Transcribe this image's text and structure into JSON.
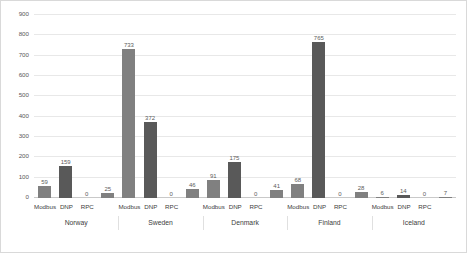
{
  "chart_data": {
    "type": "bar",
    "title": "",
    "subtitle": "",
    "xlabel": "",
    "ylabel": "",
    "ylim": [
      0,
      900
    ],
    "ytick_step": 100,
    "yticks": [
      0,
      100,
      200,
      300,
      400,
      500,
      600,
      700,
      800,
      900
    ],
    "ytick_labels": [
      "0",
      "100",
      "200",
      "300",
      "400",
      "500",
      "600",
      "700",
      "800",
      "900"
    ],
    "grid": true,
    "grid_axis": "y",
    "legend": false,
    "legend_position": "none",
    "categories": [
      "Norway",
      "Sweden",
      "Denmark",
      "Finland",
      "Iceland"
    ],
    "subcategories": [
      "Modbus",
      "DNP",
      "RPC",
      ""
    ],
    "bar_colors": [
      "#808080",
      "#595959",
      "#808080",
      "#808080"
    ],
    "groups": [
      {
        "name": "Norway",
        "bars": [
          {
            "label": "Modbus",
            "value": 59,
            "value_label": "59",
            "color": "#808080"
          },
          {
            "label": "DNP",
            "value": 159,
            "value_label": "159",
            "color": "#595959"
          },
          {
            "label": "RPC",
            "value": 0,
            "value_label": "0",
            "color": "#808080"
          },
          {
            "label": "",
            "value": 25,
            "value_label": "25",
            "color": "#808080"
          }
        ]
      },
      {
        "name": "Sweden",
        "bars": [
          {
            "label": "Modbus",
            "value": 733,
            "value_label": "733",
            "color": "#808080"
          },
          {
            "label": "DNP",
            "value": 372,
            "value_label": "372",
            "color": "#595959"
          },
          {
            "label": "RPC",
            "value": 0,
            "value_label": "0",
            "color": "#808080"
          },
          {
            "label": "",
            "value": 46,
            "value_label": "46",
            "color": "#808080"
          }
        ]
      },
      {
        "name": "Denmark",
        "bars": [
          {
            "label": "Modbus",
            "value": 91,
            "value_label": "91",
            "color": "#808080"
          },
          {
            "label": "DNP",
            "value": 175,
            "value_label": "175",
            "color": "#595959"
          },
          {
            "label": "RPC",
            "value": 0,
            "value_label": "0",
            "color": "#808080"
          },
          {
            "label": "",
            "value": 41,
            "value_label": "41",
            "color": "#808080"
          }
        ]
      },
      {
        "name": "Finland",
        "bars": [
          {
            "label": "Modbus",
            "value": 68,
            "value_label": "68",
            "color": "#808080"
          },
          {
            "label": "DNP",
            "value": 765,
            "value_label": "765",
            "color": "#595959"
          },
          {
            "label": "RPC",
            "value": 0,
            "value_label": "0",
            "color": "#808080"
          },
          {
            "label": "",
            "value": 28,
            "value_label": "28",
            "color": "#808080"
          }
        ]
      },
      {
        "name": "Iceland",
        "bars": [
          {
            "label": "Modbus",
            "value": 6,
            "value_label": "6",
            "color": "#808080"
          },
          {
            "label": "DNP",
            "value": 14,
            "value_label": "14",
            "color": "#595959"
          },
          {
            "label": "RPC",
            "value": 0,
            "value_label": "0",
            "color": "#808080"
          },
          {
            "label": "",
            "value": 7,
            "value_label": "7",
            "color": "#808080"
          }
        ]
      }
    ],
    "colors": {
      "background": "#ffffff",
      "gridline": "#e8e8e8",
      "baseline": "#c9c9c9",
      "tick_text": "#595959",
      "value_text": "#5c5c5c",
      "border": "#d9d9d9"
    }
  }
}
